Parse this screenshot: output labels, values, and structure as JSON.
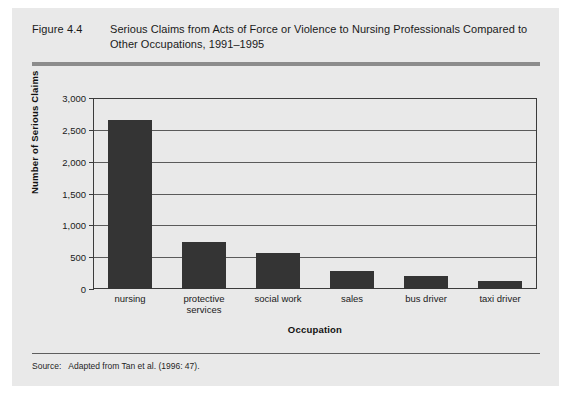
{
  "figure": {
    "number": "Figure 4.4",
    "title": "Serious Claims from Acts of Force or Violence to Nursing Professionals Compared to Other Occupations, 1991–1995",
    "source_label": "Source:",
    "source_text": "Adapted from Tan et al. (1996: 47)."
  },
  "colors": {
    "panel_background": "#e9e9e9",
    "bar_fill": "#343434",
    "rule": "#8c8c8c",
    "gridline": "#5a5a5a",
    "axis": "#3b3b3b",
    "text": "#1a1a1a"
  },
  "chart_data": {
    "type": "bar",
    "title": "Serious Claims from Acts of Force or Violence to Nursing Professionals Compared to Other Occupations, 1991–1995",
    "xlabel": "Occupation",
    "ylabel": "Number of Serious Claims",
    "categories": [
      "nursing",
      "protective services",
      "social work",
      "sales",
      "bus driver",
      "taxi driver"
    ],
    "values": [
      2660,
      740,
      560,
      280,
      200,
      130
    ],
    "ylim": [
      0,
      3000
    ],
    "yticks": [
      0,
      500,
      1000,
      1500,
      2000,
      2500,
      3000
    ],
    "ytick_labels": [
      "0",
      "500",
      "1,000",
      "1,500",
      "2,000",
      "2,500",
      "3,000"
    ],
    "grid": true,
    "legend": false
  }
}
